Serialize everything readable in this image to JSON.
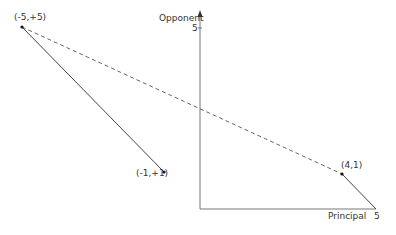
{
  "diagram": {
    "axes": {
      "y_label": "Opponent",
      "y_tick": "5",
      "x_label": "Principal",
      "x_tick": "5"
    },
    "points": [
      {
        "id": "p1",
        "label": "(-5,+5)"
      },
      {
        "id": "p2",
        "label": "(-1,+1)"
      },
      {
        "id": "p3",
        "label": "(4,1)"
      }
    ],
    "segments": [
      {
        "from": "(-5,+5)",
        "to": "(-1,+1)",
        "style": "solid"
      },
      {
        "from": "(-5,+5)",
        "to": "(4,1)",
        "style": "dashed"
      },
      {
        "from": "(4,1)",
        "to": "(5,0)",
        "style": "solid"
      }
    ],
    "colors": {
      "line": "#444444",
      "axis": "#777777"
    }
  }
}
